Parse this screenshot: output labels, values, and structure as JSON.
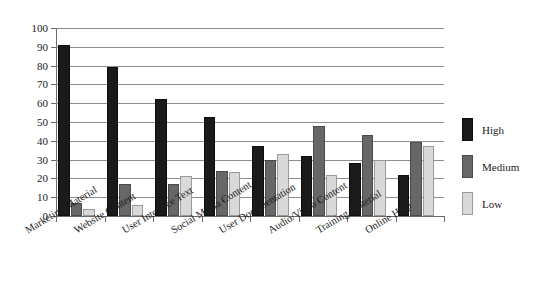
{
  "chart_data": {
    "type": "bar",
    "title": "",
    "subtitle": "",
    "xlabel": "",
    "ylabel": "",
    "ylim": [
      0,
      100
    ],
    "ytick_step": 10,
    "yticks": [
      0,
      10,
      20,
      30,
      40,
      50,
      60,
      70,
      80,
      90,
      100
    ],
    "grid": true,
    "grid_axis": "y",
    "legend_position": "right",
    "orientation": "vertical",
    "grouping": "grouped",
    "categories": [
      "Marketing Material",
      "Website Content",
      "User Interface Text",
      "Social Media Content",
      "User Documentation",
      "Audio/Video Content",
      "Training Material",
      "Online Help"
    ],
    "series": [
      {
        "name": "High",
        "color": "#1a1a1a",
        "values": [
          91,
          79,
          62,
          52.5,
          37.5,
          32,
          28,
          22
        ]
      },
      {
        "name": "Medium",
        "color": "#676767",
        "values": [
          7,
          17,
          17,
          24,
          30,
          48,
          43,
          39.5
        ]
      },
      {
        "name": "Low",
        "color": "#d9d9d9",
        "values": [
          3.5,
          6,
          21.5,
          23.5,
          33,
          22,
          30,
          37.5
        ]
      }
    ],
    "annotations": []
  },
  "legend": {
    "items": [
      {
        "label": "High",
        "series_key": "s-high"
      },
      {
        "label": "Medium",
        "series_key": "s-medium"
      },
      {
        "label": "Low",
        "series_key": "s-low"
      }
    ]
  },
  "colors": {
    "high": "#1a1a1a",
    "medium": "#676767",
    "low": "#d9d9d9",
    "axis": "#6b6b6b",
    "gridline": "#8d8d8d",
    "background": "#ffffff",
    "text": "#1a1a1a"
  }
}
